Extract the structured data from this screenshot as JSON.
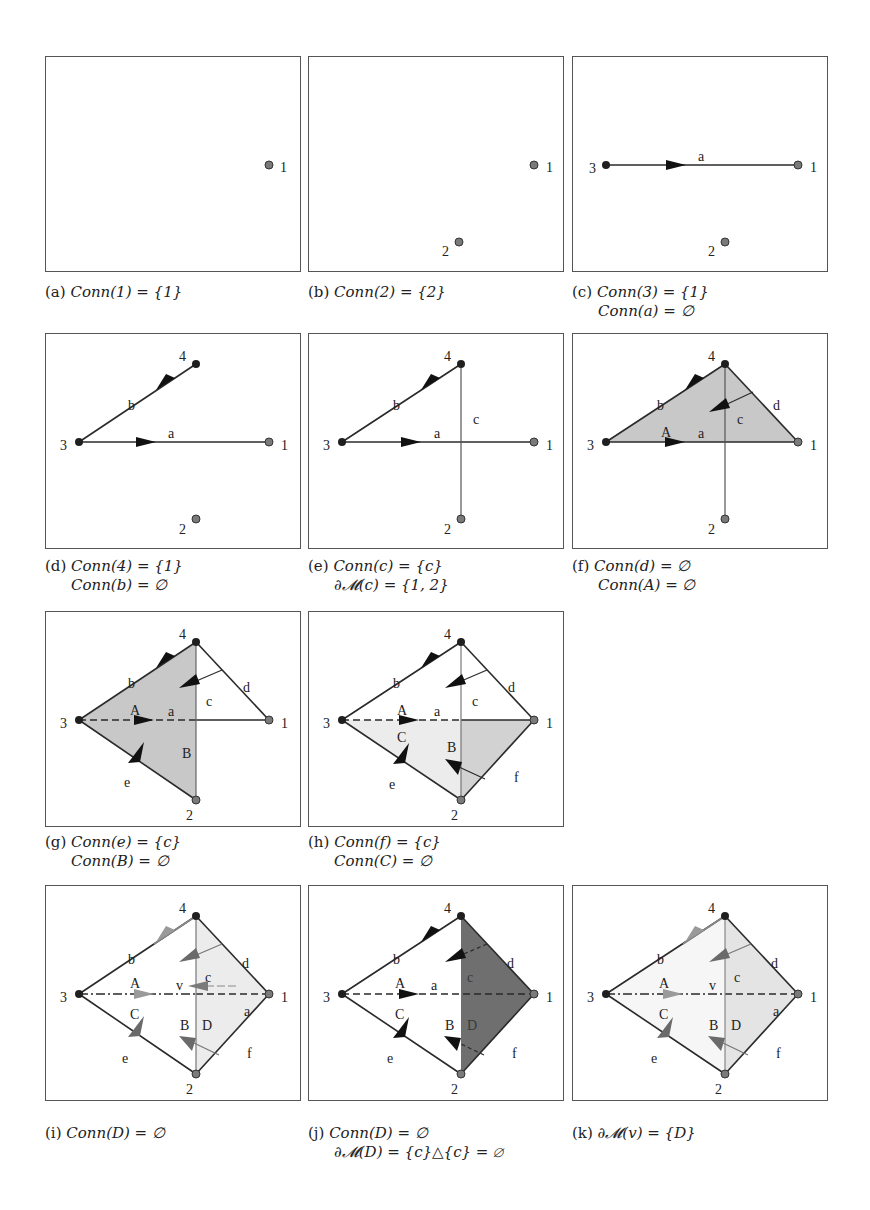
{
  "figure": {
    "colors": {
      "border": "#555555",
      "edge": "#2a2a2a",
      "vertex_dark": "#1f1f1f",
      "vertex_gray": "#7a7a7a",
      "fill_medium": "#c8c8c8",
      "fill_light": "#ececec",
      "fill_dark": "#6f6f6f",
      "arrow_gray": "#8a8a8a"
    },
    "panels": [
      {
        "id": "a",
        "label": "(a)",
        "line1": "Conn(1) = {1}",
        "line2": ""
      },
      {
        "id": "b",
        "label": "(b)",
        "line1": "Conn(2) = {2}",
        "line2": ""
      },
      {
        "id": "c",
        "label": "(c)",
        "line1": "Conn(3) = {1}",
        "line2": "Conn(a) = ∅"
      },
      {
        "id": "d",
        "label": "(d)",
        "line1": "Conn(4) = {1}",
        "line2": "Conn(b) = ∅"
      },
      {
        "id": "e",
        "label": "(e)",
        "line1": "Conn(c) = {c}",
        "line2": "∂𝓜(c) = {1, 2}"
      },
      {
        "id": "f",
        "label": "(f)",
        "line1": "Conn(d) = ∅",
        "line2": "Conn(A) = ∅"
      },
      {
        "id": "g",
        "label": "(g)",
        "line1": "Conn(e) = {c}",
        "line2": "Conn(B) = ∅"
      },
      {
        "id": "h",
        "label": "(h)",
        "line1": "Conn(f) = {c}",
        "line2": "Conn(C) = ∅"
      },
      {
        "id": "i",
        "label": "(i)",
        "line1": "Conn(D) = ∅",
        "line2": ""
      },
      {
        "id": "j",
        "label": "(j)",
        "line1": "Conn(D) = ∅",
        "line2": "∂𝓜(D) = {c}△{c} = ∅"
      },
      {
        "id": "k",
        "label": "(k)",
        "line1": "∂𝓜(v) = {D}",
        "line2": ""
      }
    ],
    "labels": {
      "v1": "1",
      "v2": "2",
      "v3": "3",
      "v4": "4",
      "ea": "a",
      "eb": "b",
      "ec": "c",
      "ed": "d",
      "ee": "e",
      "ef": "f",
      "fA": "A",
      "fB": "B",
      "fC": "C",
      "fD": "D",
      "vv": "v"
    }
  }
}
